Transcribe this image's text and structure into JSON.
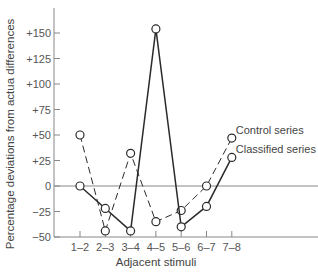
{
  "chart_data": {
    "type": "line",
    "title": "",
    "xlabel": "Adjacent stimuli",
    "ylabel": "Percentage deviations from actua differences",
    "categories": [
      "1–2",
      "2–3",
      "3–4",
      "4–5",
      "5–6",
      "6–7",
      "7–8"
    ],
    "series": [
      {
        "name": "Control series",
        "style": "dashed",
        "values": [
          50,
          -44,
          32,
          -35,
          -24,
          0,
          47
        ]
      },
      {
        "name": "Classified series",
        "style": "solid",
        "values": [
          0,
          -22,
          -44,
          154,
          -40,
          -20,
          28
        ]
      }
    ],
    "yticks": [
      -50,
      -25,
      0,
      25,
      50,
      75,
      100,
      125,
      150
    ],
    "ytick_labels": [
      "−50",
      "−25",
      "0",
      "+25",
      "+50",
      "+75",
      "+100",
      "+125",
      "+150"
    ],
    "ylim": [
      -50,
      170
    ],
    "grid": false,
    "zero_line": true,
    "legend_position": "inline-right",
    "colors": {
      "line": "#2b2b2b",
      "axis": "#888888",
      "marker_fill": "#ffffff"
    }
  }
}
